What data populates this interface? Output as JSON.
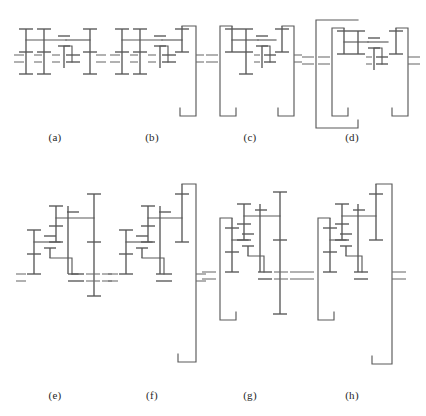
{
  "figure": {
    "domain_note": "Eight stick-diagram schematics of compound planetary / epicyclic gear trains arranged in two rows of four.",
    "background_color": "#ffffff",
    "line_color": "#5a5a5a",
    "caption_color": "#262626",
    "rows": 2,
    "columns": 4,
    "panels": [
      {
        "id": "a",
        "caption": "(a)",
        "caption_x": 55,
        "caption_y": 138,
        "origin_x": 14,
        "origin_y": 22,
        "width": 90,
        "height": 74,
        "has_left_ring": false,
        "has_right_ring": false,
        "has_outer_ring": false,
        "shaft_count": 5,
        "carrier_bars": 2,
        "description": "Open compound train, no ring housing; four vertical shafts joined by an upper carrier bar and a lower offset carrier."
      },
      {
        "id": "b",
        "caption": "(b)",
        "caption_x": 152,
        "caption_y": 138,
        "origin_x": 110,
        "origin_y": 16,
        "width": 92,
        "height": 108,
        "has_left_ring": false,
        "has_right_ring": true,
        "has_outer_ring": false,
        "shaft_count": 5,
        "carrier_bars": 2,
        "description": "Same core train as (a) with a tall right-hand ring-gear bracket carried down to the output centreline."
      },
      {
        "id": "c",
        "caption": "(c)",
        "caption_x": 250,
        "caption_y": 138,
        "origin_x": 206,
        "origin_y": 16,
        "width": 94,
        "height": 108,
        "has_left_ring": true,
        "has_right_ring": true,
        "has_outer_ring": false,
        "shaft_count": 5,
        "carrier_bars": 2,
        "description": "Core train flanked by two ring-gear brackets, one on each side, each returning to its own centreline."
      },
      {
        "id": "d",
        "caption": "(d)",
        "caption_x": 352,
        "caption_y": 138,
        "origin_x": 302,
        "origin_y": 12,
        "width": 112,
        "height": 120,
        "has_left_ring": true,
        "has_right_ring": true,
        "has_outer_ring": true,
        "shaft_count": 5,
        "carrier_bars": 2,
        "description": "Core train with two inner ring brackets plus an additional outer housing bracket nested around the left pair."
      },
      {
        "id": "e",
        "caption": "(e)",
        "caption_x": 55,
        "caption_y": 396,
        "origin_x": 16,
        "origin_y": 176,
        "width": 92,
        "height": 142,
        "has_left_ring": false,
        "has_right_ring": false,
        "has_outer_ring": false,
        "shaft_count": 6,
        "carrier_bars": 3,
        "description": "Cascading three-stage train, open frame, stepped carriers descending left to right."
      },
      {
        "id": "f",
        "caption": "(f)",
        "caption_x": 152,
        "caption_y": 396,
        "origin_x": 108,
        "origin_y": 170,
        "width": 96,
        "height": 200,
        "has_left_ring": false,
        "has_right_ring": true,
        "has_outer_ring": false,
        "shaft_count": 6,
        "carrier_bars": 3,
        "description": "Cascading train of (e) enclosed at the right by a very tall ring bracket reaching well below the train."
      },
      {
        "id": "g",
        "caption": "(g)",
        "caption_x": 250,
        "caption_y": 396,
        "origin_x": 202,
        "origin_y": 172,
        "width": 96,
        "height": 160,
        "has_left_ring": true,
        "has_right_ring": false,
        "has_outer_ring": false,
        "shaft_count": 6,
        "carrier_bars": 3,
        "description": "Cascading train with a left-hand ring bracket dropping to the lower-left centreline."
      },
      {
        "id": "h",
        "caption": "(h)",
        "caption_x": 352,
        "caption_y": 396,
        "origin_x": 300,
        "origin_y": 170,
        "width": 110,
        "height": 202,
        "has_left_ring": true,
        "has_right_ring": true,
        "has_outer_ring": false,
        "shaft_count": 6,
        "carrier_bars": 3,
        "description": "Cascading train bracketed on both sides: a short left ring bracket and a tall right ring bracket."
      }
    ]
  }
}
